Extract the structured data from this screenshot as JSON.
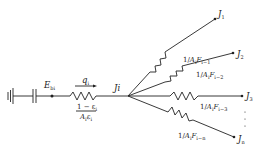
{
  "diagram": {
    "type": "radiation network",
    "source": {
      "node_label": "E",
      "node_sub": "bi"
    },
    "surface_resistance": {
      "heat_flow_label": "q",
      "heat_flow_sub": "i",
      "numerator": "1 − ε",
      "numerator_sub": "i",
      "denominator_A": "A",
      "denominator_A_sub": "i",
      "denominator_eps": "ε",
      "denominator_eps_sub": "i"
    },
    "junction": {
      "label": "Ji"
    },
    "branches": [
      {
        "node_main": "J",
        "node_sub": "1",
        "res_prefix": "1/",
        "res_A": "A",
        "res_A_sub": "i",
        "res_F": "F",
        "res_F_sub": "i−1"
      },
      {
        "node_main": "J",
        "node_sub": "2",
        "res_prefix": "1/",
        "res_A": "A",
        "res_A_sub": "i",
        "res_F": "F",
        "res_F_sub": "i−2"
      },
      {
        "node_main": "J",
        "node_sub": "3",
        "res_prefix": "1/",
        "res_A": "A",
        "res_A_sub": "i",
        "res_F": "F",
        "res_F_sub": "i−3"
      },
      {
        "node_main": "J",
        "node_sub": "n",
        "res_prefix": "1/",
        "res_A": "A",
        "res_A_sub": "i",
        "res_F": "F",
        "res_F_sub": "i−n"
      }
    ],
    "continuation": "⋮"
  }
}
